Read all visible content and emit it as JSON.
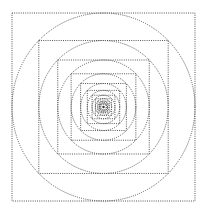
{
  "diagram": {
    "title": "",
    "stroke_color": "#555555",
    "background": "#ffffff",
    "center": {
      "x": 103.5,
      "y": 107
    },
    "outer_half_width": 91.5,
    "outer_half_height": 94,
    "scale_ratio": 0.7071,
    "levels": 11,
    "center_dot": true
  }
}
